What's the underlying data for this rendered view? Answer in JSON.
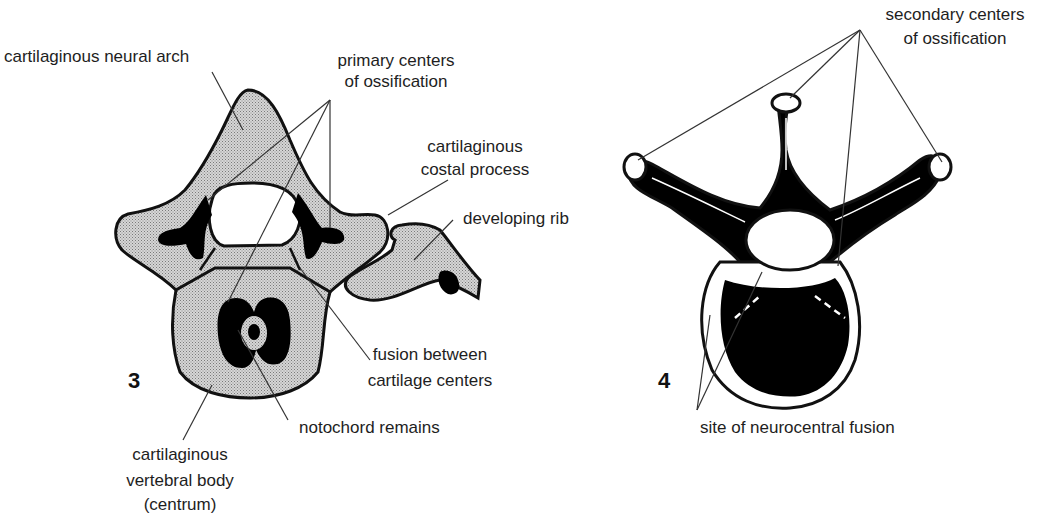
{
  "figures": [
    {
      "number": "3",
      "labels": {
        "neural_arch": "cartilaginous neural arch",
        "primary_centers_1": "primary centers",
        "primary_centers_2": "of ossification",
        "costal_process_1": "cartilaginous",
        "costal_process_2": "costal process",
        "developing_rib": "developing rib",
        "fusion_1": "fusion between",
        "fusion_2": "cartilage centers",
        "notochord": "notochord remains",
        "body_1": "cartilaginous",
        "body_2": "vertebral body",
        "body_3": "(centrum)"
      }
    },
    {
      "number": "4",
      "labels": {
        "secondary_1": "secondary centers",
        "secondary_2": "of ossification",
        "neurocentral": "site of neurocentral fusion"
      }
    }
  ],
  "colors": {
    "cartilage_fill": "#c8c8c8",
    "bone_fill": "#000000",
    "outline": "#111111",
    "background": "#ffffff"
  }
}
